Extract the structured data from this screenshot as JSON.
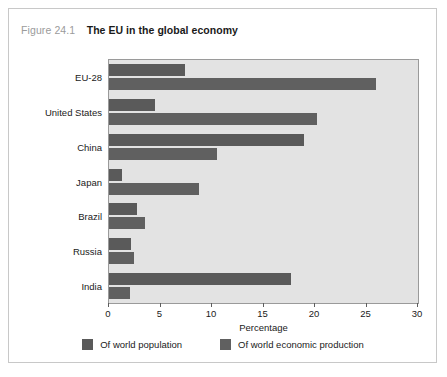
{
  "figure": {
    "number": "Figure 24.1",
    "title": "The EU in the global economy"
  },
  "chart_data": {
    "type": "bar",
    "orientation": "horizontal",
    "title": "The EU in the global economy",
    "xlabel": "Percentage",
    "ylabel": "",
    "xlim": [
      0,
      30
    ],
    "xticks": [
      "0",
      "5",
      "10",
      "15",
      "20",
      "25",
      "30"
    ],
    "grid": false,
    "legend_position": "bottom",
    "categories": [
      "EU-28",
      "United States",
      "China",
      "Japan",
      "Brazil",
      "Russia",
      "India"
    ],
    "series": [
      {
        "name": "Of world population",
        "color": "#5a5a5a",
        "values": [
          7.4,
          4.5,
          18.9,
          1.3,
          2.7,
          2.1,
          17.7
        ]
      },
      {
        "name": "Of world economic production",
        "color": "#606060",
        "values": [
          25.9,
          20.2,
          10.5,
          8.7,
          3.5,
          2.4,
          2.0
        ]
      }
    ]
  }
}
